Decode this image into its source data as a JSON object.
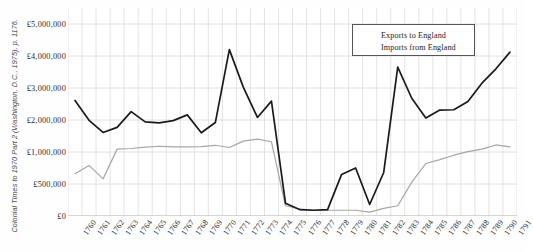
{
  "figure": {
    "source_caption": "Colonial Times to 1970 Part 2 (Washington, D.C., 1975), p. 1176."
  },
  "legend": {
    "position": "top-right",
    "entries": [
      {
        "label": "Exports to England",
        "color": "#a6a6a6"
      },
      {
        "label": "Imports from England",
        "color": "#1a1a1a"
      }
    ]
  },
  "chart_data": {
    "type": "line",
    "title": "",
    "subtitle": "",
    "xlabel": "",
    "ylabel": "",
    "grid": true,
    "legend_position": "top-right",
    "ylim": [
      0,
      5500000
    ],
    "y_ticks": [
      0,
      500000,
      1000000,
      2000000,
      3000000,
      4000000,
      5000000
    ],
    "y_tick_labels": [
      "£0",
      "£500,000",
      "£1,000,000",
      "£2,000,000",
      "£3,000,000",
      "£4,000,000",
      "£5,000,000"
    ],
    "categories": [
      "1760",
      "1761",
      "1762",
      "1763",
      "1764",
      "1765",
      "1766",
      "1767",
      "1768",
      "1769",
      "1770",
      "1771",
      "1772",
      "1773",
      "1774",
      "1775",
      "1776",
      "1777",
      "1778",
      "1779",
      "1780",
      "1781",
      "1782",
      "1783",
      "1784",
      "1785",
      "1786",
      "1787",
      "1788",
      "1789",
      "1790",
      "1791"
    ],
    "x_tick_labels": [
      "1760",
      "1761",
      "1762",
      "1763",
      "1764",
      "1765",
      "1766",
      "1767",
      "1768",
      "1769",
      "1770",
      "1771",
      "1772",
      "1773",
      "1774",
      "1775",
      "1776",
      "1777",
      "1778",
      "1779",
      "1780",
      "1781",
      "1782",
      "1783",
      "1784",
      "1785",
      "1786",
      "1787",
      "1788",
      "1789",
      "1790",
      "1791"
    ],
    "series": [
      {
        "name": "Exports to England",
        "color": "#a6a6a6",
        "values": [
          660000,
          790000,
          580000,
          1090000,
          1110000,
          1150000,
          1180000,
          1160000,
          1160000,
          1170000,
          1210000,
          1140000,
          1340000,
          1400000,
          1320000,
          160000,
          110000,
          90000,
          90000,
          90000,
          90000,
          60000,
          120000,
          160000,
          530000,
          820000,
          880000,
          950000,
          1010000,
          1090000,
          1220000,
          1160000
        ]
      },
      {
        "name": "Imports from England",
        "color": "#1a1a1a",
        "values": [
          2610000,
          1990000,
          1610000,
          1770000,
          2260000,
          1940000,
          1910000,
          1980000,
          2160000,
          1600000,
          1920000,
          4200000,
          3020000,
          2080000,
          2590000,
          200000,
          100000,
          90000,
          100000,
          650000,
          750000,
          180000,
          680000,
          3650000,
          2680000,
          2060000,
          2310000,
          2320000,
          2580000,
          3150000,
          3600000,
          4120000
        ]
      }
    ]
  }
}
